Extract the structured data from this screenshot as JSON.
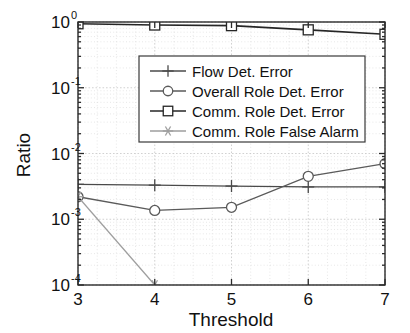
{
  "chart_data": {
    "type": "line",
    "title": "",
    "xlabel": "Threshold",
    "ylabel": "Ratio",
    "x": [
      3,
      4,
      5,
      6,
      7
    ],
    "xticklabels": [
      "3",
      "4",
      "5",
      "6",
      "7"
    ],
    "xlim": [
      3,
      7
    ],
    "yscale": "log",
    "ylim": [
      0.0001,
      1
    ],
    "yticklabels": [
      "10",
      "10",
      "10",
      "10",
      "10"
    ],
    "ytickexponents": [
      "0",
      "-1",
      "-2",
      "-3",
      "-4"
    ],
    "ytickvalues": [
      1,
      0.1,
      0.01,
      0.001,
      0.0001
    ],
    "grid": true,
    "legend_position": "upper center",
    "series": [
      {
        "name": "Flow Det. Error",
        "marker": "plus",
        "color": "#4a4a4a",
        "x": [
          3,
          4,
          5,
          6,
          7
        ],
        "values": [
          0.0034,
          0.0033,
          0.0032,
          0.0031,
          0.0031
        ]
      },
      {
        "name": "Overall Role Det. Error",
        "marker": "circle",
        "color": "#5a5a5a",
        "x": [
          3,
          4,
          5,
          6,
          7
        ],
        "values": [
          0.0022,
          0.00136,
          0.00152,
          0.0045,
          0.007
        ]
      },
      {
        "name": "Comm. Role Det. Error",
        "marker": "square",
        "color": "#262626",
        "x": [
          3,
          4,
          5,
          6,
          7
        ],
        "values": [
          0.94,
          0.9,
          0.88,
          0.76,
          0.65
        ]
      },
      {
        "name": "Comm. Role False Alarm",
        "marker": "asterisk",
        "color": "#9e9e9e",
        "x": [
          3,
          4
        ],
        "values": [
          0.0022,
          0.0001
        ]
      }
    ]
  },
  "axes": {
    "ylabel": "Ratio",
    "xlabel": "Threshold"
  }
}
